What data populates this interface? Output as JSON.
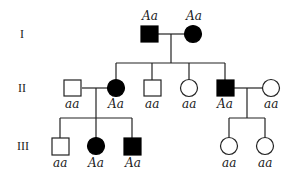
{
  "pedigree": {
    "generations": [
      {
        "label": "I",
        "y": 37
      },
      {
        "label": "II",
        "y": 91
      },
      {
        "label": "III",
        "y": 149
      }
    ],
    "individuals": [
      {
        "id": "I-1",
        "sex": "male",
        "affected": true,
        "genotype": "Aa",
        "x": 149,
        "y": 34
      },
      {
        "id": "I-2",
        "sex": "female",
        "affected": true,
        "genotype": "Aa",
        "x": 193,
        "y": 34
      },
      {
        "id": "II-1",
        "sex": "male",
        "affected": false,
        "genotype": "aa",
        "x": 73,
        "y": 88
      },
      {
        "id": "II-2",
        "sex": "female",
        "affected": true,
        "genotype": "Aa",
        "x": 116,
        "y": 88
      },
      {
        "id": "II-3",
        "sex": "male",
        "affected": false,
        "genotype": "aa",
        "x": 152,
        "y": 88
      },
      {
        "id": "II-4",
        "sex": "female",
        "affected": false,
        "genotype": "aa",
        "x": 189,
        "y": 88
      },
      {
        "id": "II-5",
        "sex": "male",
        "affected": true,
        "genotype": "Aa",
        "x": 225,
        "y": 88
      },
      {
        "id": "II-6",
        "sex": "female",
        "affected": false,
        "genotype": "aa",
        "x": 271,
        "y": 88
      },
      {
        "id": "III-1",
        "sex": "male",
        "affected": false,
        "genotype": "aa",
        "x": 60,
        "y": 146
      },
      {
        "id": "III-2",
        "sex": "female",
        "affected": true,
        "genotype": "Aa",
        "x": 96,
        "y": 146
      },
      {
        "id": "III-3",
        "sex": "male",
        "affected": true,
        "genotype": "Aa",
        "x": 132,
        "y": 146
      },
      {
        "id": "III-4",
        "sex": "female",
        "affected": false,
        "genotype": "aa",
        "x": 229,
        "y": 146
      },
      {
        "id": "III-5",
        "sex": "female",
        "affected": false,
        "genotype": "aa",
        "x": 265,
        "y": 146
      }
    ]
  },
  "labels": {
    "gen_I": "I",
    "gen_II": "II",
    "gen_III": "III",
    "I1": "Aa",
    "I2": "Aa",
    "II1": "aa",
    "II2": "Aa",
    "II3": "aa",
    "II4": "aa",
    "II5": "Aa",
    "II6": "aa",
    "III1": "aa",
    "III2": "Aa",
    "III3": "Aa",
    "III4": "aa",
    "III5": "aa"
  },
  "colors": {
    "line": "#222222",
    "affected": "#000000",
    "unaffected": "#ffffff"
  }
}
